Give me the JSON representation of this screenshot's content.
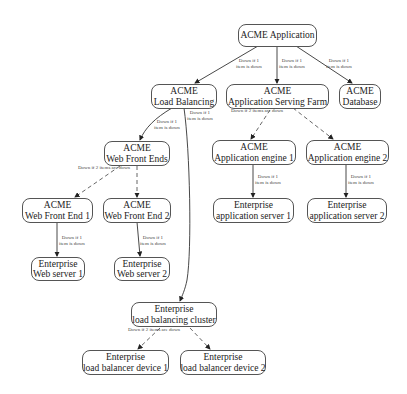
{
  "diagram": {
    "type": "hierarchy",
    "nodes": [
      {
        "id": "app",
        "line1": "ACME Application",
        "line2": ""
      },
      {
        "id": "lb",
        "line1": "ACME",
        "line2": "Load Balancing"
      },
      {
        "id": "farm",
        "line1": "ACME",
        "line2": "Application Serving Farm"
      },
      {
        "id": "db",
        "line1": "ACME",
        "line2": "Database"
      },
      {
        "id": "wfe",
        "line1": "ACME",
        "line2": "Web Front Ends"
      },
      {
        "id": "ae1",
        "line1": "ACME",
        "line2": "Application engine 1"
      },
      {
        "id": "ae2",
        "line1": "ACME",
        "line2": "Application engine 2"
      },
      {
        "id": "wfe1",
        "line1": "ACME",
        "line2": "Web Front End 1"
      },
      {
        "id": "wfe2",
        "line1": "ACME",
        "line2": "Web Front End 2"
      },
      {
        "id": "as1",
        "line1": "Enterprise",
        "line2": "application server 1"
      },
      {
        "id": "as2",
        "line1": "Enterprise",
        "line2": "application server 2"
      },
      {
        "id": "ws1",
        "line1": "Enterprise",
        "line2": "Web server 1"
      },
      {
        "id": "ws2",
        "line1": "Enterprise",
        "line2": "Web server 2"
      },
      {
        "id": "lbc",
        "line1": "Enterprise",
        "line2": "load balancing cluster"
      },
      {
        "id": "lbd1",
        "line1": "Enterprise",
        "line2": "load balancer device 1"
      },
      {
        "id": "lbd2",
        "line1": "Enterprise",
        "line2": "load balancer device 2"
      }
    ],
    "edge_labels": {
      "app_lb": [
        "Down if 1",
        "item is down"
      ],
      "app_farm": [
        "Down if 1",
        "item is down"
      ],
      "app_db": [
        "Down if 1",
        "item is down"
      ],
      "lb_wfe": [
        "Down if 1",
        "item is down"
      ],
      "lb_lbc": [
        "Down if 1",
        "item is down"
      ],
      "farm_group": [
        "Down if 2 items are down"
      ],
      "wfe_group": [
        "Down if 2 items are down"
      ],
      "wfe1_ws1": [
        "Down if 1",
        "item is down"
      ],
      "wfe2_ws2": [
        "Down if 1",
        "item is down"
      ],
      "ae1_as1": [
        "Down if 1",
        "item is down"
      ],
      "ae2_as2": [
        "Down if 1",
        "item is down"
      ],
      "lbc_group": [
        "Down if 2 items are down"
      ]
    }
  }
}
